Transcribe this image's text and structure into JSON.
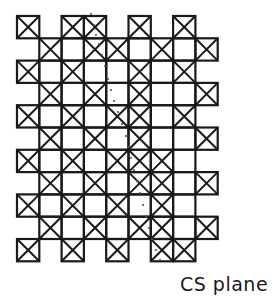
{
  "diagram": {
    "caption": "CS plane",
    "stroke_color": "#1a1a1a",
    "dot_color": "#555555",
    "grid": {
      "origin_x": 17,
      "origin_y": 16,
      "cell": 22.3,
      "columns": 9,
      "legend": "X = crossed cell, O = plain cell, . = empty",
      "rows": [
        "X.XX.X.X.",
        ".XOXXOXOX",
        "XOXOOXOX.",
        ".XOXOXOOX",
        "XOXOXXOX.",
        ".XOXOXOOX",
        "XOXOXXXO.",
        ".XOXOXXOX",
        "XOXOXOXO.",
        ".XOXOXXOX",
        "X.X.X.XX."
      ]
    },
    "dotted_trace": [
      [
        91,
        14
      ],
      [
        94,
        25
      ],
      [
        96,
        35
      ],
      [
        99,
        44
      ],
      [
        102,
        55
      ],
      [
        105,
        66
      ],
      [
        108,
        79
      ],
      [
        111,
        90
      ],
      [
        114,
        101
      ],
      [
        118,
        112
      ],
      [
        122,
        124
      ],
      [
        126,
        136
      ],
      [
        129,
        147
      ],
      [
        131,
        158
      ],
      [
        134,
        170
      ],
      [
        137,
        181
      ],
      [
        140,
        193
      ],
      [
        143,
        205
      ],
      [
        146,
        216
      ],
      [
        149,
        228
      ],
      [
        152,
        239
      ],
      [
        156,
        250
      ],
      [
        160,
        260
      ]
    ]
  }
}
